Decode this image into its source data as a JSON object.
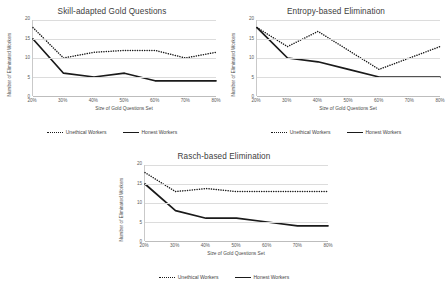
{
  "axis": {
    "ylabel": "Number of Eliminated Workers",
    "xlabel": "Size of Gold Questions Set",
    "yticks": [
      "0",
      "5",
      "10",
      "15",
      "20"
    ],
    "xticks": [
      "20%",
      "30%",
      "40%",
      "50%",
      "60%",
      "70%",
      "80%"
    ]
  },
  "legend": {
    "unethical": "Unethical Workers",
    "honest": "Honest Workers"
  },
  "colors": {
    "line": "#1a1a1a",
    "grid": "#dcdcdc",
    "text": "#404040"
  },
  "chart_data": [
    {
      "type": "line",
      "title": "Skill-adapted Gold Questions",
      "xlabel": "Size of Gold Questions Set",
      "ylabel": "Number of Eliminated Workers",
      "categories": [
        "20%",
        "30%",
        "40%",
        "50%",
        "60%",
        "70%",
        "80%"
      ],
      "ylim": [
        0,
        20
      ],
      "yticks": [
        0,
        5,
        10,
        15,
        20
      ],
      "grid": true,
      "legend_position": "bottom",
      "series": [
        {
          "name": "Unethical Workers",
          "style": "dotted",
          "values": [
            18,
            10,
            11.5,
            12,
            12,
            10,
            11.5
          ]
        },
        {
          "name": "Honest Workers",
          "style": "solid",
          "values": [
            15,
            6,
            5,
            6,
            4,
            4,
            4
          ]
        }
      ]
    },
    {
      "type": "line",
      "title": "Entropy-based Elimination",
      "xlabel": "Size of Gold Questions Set",
      "ylabel": "Number of Eliminated Workers",
      "categories": [
        "20%",
        "30%",
        "40%",
        "50%",
        "60%",
        "70%",
        "80%"
      ],
      "ylim": [
        0,
        20
      ],
      "yticks": [
        0,
        5,
        10,
        15,
        20
      ],
      "grid": true,
      "legend_position": "bottom",
      "series": [
        {
          "name": "Unethical Workers",
          "style": "dotted",
          "values": [
            18,
            13,
            17,
            12,
            7,
            10,
            13
          ]
        },
        {
          "name": "Honest Workers",
          "style": "solid",
          "values": [
            18,
            10,
            9,
            7,
            5,
            5,
            5
          ]
        }
      ]
    },
    {
      "type": "line",
      "title": "Rasch-based Elimination",
      "xlabel": "Size of Gold Questions Set",
      "ylabel": "Number of Eliminated Workers",
      "categories": [
        "20%",
        "30%",
        "40%",
        "50%",
        "60%",
        "70%",
        "80%"
      ],
      "ylim": [
        0,
        20
      ],
      "yticks": [
        0,
        5,
        10,
        15,
        20
      ],
      "grid": true,
      "legend_position": "bottom",
      "series": [
        {
          "name": "Unethical Workers",
          "style": "dotted",
          "values": [
            18,
            13,
            13.8,
            13,
            13,
            13,
            13
          ]
        },
        {
          "name": "Honest Workers",
          "style": "solid",
          "values": [
            15,
            8,
            6,
            6,
            5,
            4,
            4
          ]
        }
      ]
    }
  ]
}
